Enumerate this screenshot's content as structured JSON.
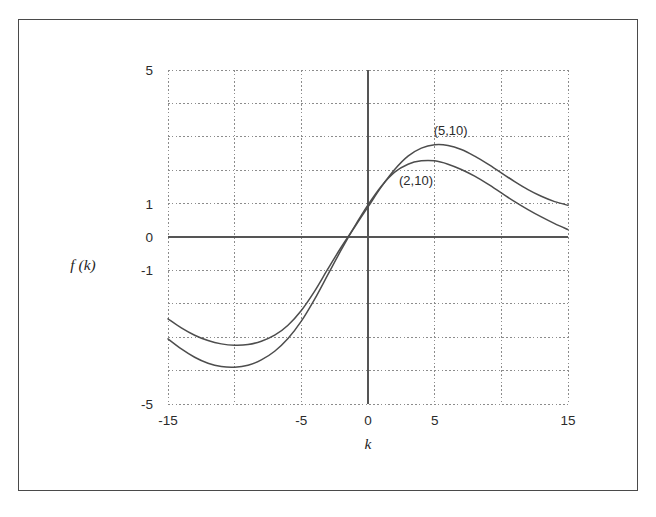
{
  "chart_data": {
    "type": "line",
    "title": "",
    "xlabel": "k",
    "ylabel": "f (k)",
    "xlim": [
      -15,
      15
    ],
    "ylim": [
      -5,
      5
    ],
    "grid": true,
    "grid_x_step": 5,
    "grid_y_step": 1,
    "legend": "inline-annotations",
    "x_ticks": [
      {
        "value": -15,
        "label": "-15"
      },
      {
        "value": -5,
        "label": "-5"
      },
      {
        "value": 0,
        "label": "0"
      },
      {
        "value": 5,
        "label": "5"
      },
      {
        "value": 15,
        "label": "15"
      }
    ],
    "y_ticks": [
      {
        "value": 5,
        "label": "5"
      },
      {
        "value": 1,
        "label": "1"
      },
      {
        "value": 0,
        "label": "0"
      },
      {
        "value": -1,
        "label": "-1"
      },
      {
        "value": -5,
        "label": "-5"
      }
    ],
    "annotations": [
      {
        "text": "(5,10)",
        "x": 6.2,
        "y": 3.05
      },
      {
        "text": "(2,10)",
        "x": 3.6,
        "y": 1.55
      }
    ],
    "series": [
      {
        "name": "(5,10)",
        "label": "(5,10)",
        "color": "#4d4d4d",
        "x": [
          -15,
          -14,
          -13,
          -12,
          -11,
          -10,
          -9,
          -8,
          -7,
          -6,
          -5,
          -4,
          -3,
          -2,
          -1,
          0,
          1,
          2,
          3,
          4,
          5,
          6,
          7,
          8,
          9,
          10,
          11,
          12,
          13,
          14,
          15
        ],
        "y": [
          -2.45,
          -2.72,
          -2.94,
          -3.1,
          -3.2,
          -3.24,
          -3.22,
          -3.12,
          -2.94,
          -2.64,
          -2.2,
          -1.62,
          -0.95,
          -0.3,
          0.3,
          0.9,
          1.5,
          2.02,
          2.42,
          2.66,
          2.76,
          2.74,
          2.62,
          2.42,
          2.18,
          1.92,
          1.66,
          1.42,
          1.22,
          1.06,
          0.95
        ]
      },
      {
        "name": "(2,10)",
        "label": "(2,10)",
        "color": "#4d4d4d",
        "x": [
          -15,
          -14,
          -13,
          -12,
          -11,
          -10,
          -9,
          -8,
          -7,
          -6,
          -5,
          -4,
          -3,
          -2,
          -1,
          0,
          1,
          2,
          3,
          4,
          5,
          6,
          7,
          8,
          9,
          10,
          11,
          12,
          13,
          14,
          15
        ],
        "y": [
          -3.05,
          -3.35,
          -3.6,
          -3.78,
          -3.88,
          -3.9,
          -3.84,
          -3.68,
          -3.42,
          -3.04,
          -2.52,
          -1.86,
          -1.12,
          -0.38,
          0.32,
          0.96,
          1.52,
          1.94,
          2.18,
          2.28,
          2.28,
          2.18,
          2.02,
          1.82,
          1.58,
          1.32,
          1.06,
          0.82,
          0.6,
          0.4,
          0.22
        ]
      }
    ]
  },
  "figure": {
    "frame_color": "#4a4a4a",
    "background": "#ffffff"
  }
}
